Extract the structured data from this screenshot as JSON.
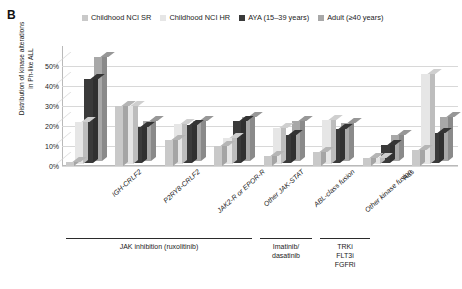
{
  "panel": {
    "letter": "B"
  },
  "legend": {
    "items": [
      {
        "label": "Childhood NCI SR",
        "color": "#c9c9c9"
      },
      {
        "label": "Childhood NCI HR",
        "color": "#e6e6e6"
      },
      {
        "label": "AYA (15–39 years)",
        "color": "#3a3a3a"
      },
      {
        "label": "Adult (≥40 years)",
        "color": "#a8a8a8"
      }
    ]
  },
  "axes": {
    "y_title_line1": "Distribution of kinase alterations",
    "y_title_line2": "in Ph-like ALL",
    "y_ticks": [
      "50%",
      "40%",
      "30%",
      "20%",
      "10%",
      "0%"
    ]
  },
  "brackets": [
    {
      "text": "JAK inhibition (ruxolitinib)"
    },
    {
      "text": "Imatinib/\ndasatinib"
    },
    {
      "text": "TRKi\nFLT3i\nFGFRi"
    }
  ],
  "chart_data": {
    "type": "bar",
    "title": "",
    "xlabel": "",
    "ylabel": "Distribution of kinase alterations in Ph-like ALL",
    "ylim": [
      0,
      55
    ],
    "grid": true,
    "legend_position": "top",
    "categories": [
      "IGH-CRLF2",
      "P2RY8-CRLF2",
      "JAK2-R or EPOR-R",
      "Other JAK-STAT",
      "ABL-class fusion",
      "Other kinase fusion",
      "Ras",
      "No kinase identified"
    ],
    "series": [
      {
        "name": "Childhood NCI SR",
        "color": "#c9c9c9",
        "values": [
          2,
          30,
          13,
          10,
          5,
          7,
          4,
          8
        ]
      },
      {
        "name": "Childhood NCI HR",
        "color": "#e6e6e6",
        "values": [
          21,
          29,
          20,
          13,
          18,
          22,
          3,
          45
        ]
      },
      {
        "name": "AYA (15–39 years)",
        "color": "#3a3a3a",
        "values": [
          42,
          18,
          19,
          21,
          14,
          17,
          9,
          15
        ]
      },
      {
        "name": "Adult (≥40 years)",
        "color": "#a8a8a8",
        "values": [
          52,
          20,
          20,
          22,
          20,
          19,
          13,
          22
        ]
      }
    ]
  }
}
